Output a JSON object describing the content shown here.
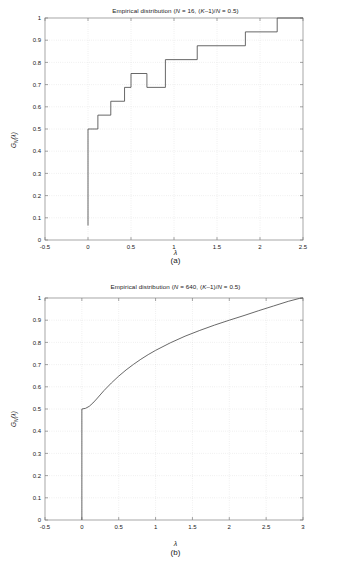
{
  "figure": {
    "background": "#ffffff",
    "line_color": "#4d4d4d",
    "axis_color": "#808080",
    "grid_color": "#cccccc"
  },
  "panel_a": {
    "caption": "(a)",
    "title": "Empirical distribution (N = 16, (K–1)/N = 0.5)",
    "title_parts": {
      "prefix": "Empirical distribution (",
      "n_symbol": "N",
      "n_eq": " = 16, (",
      "k_symbol": "K",
      "k_mid": "–1)/",
      "n_symbol2": "N",
      "suffix": " = 0.5)"
    },
    "xlabel": "λ",
    "ylabel": "G_N(λ)",
    "ylabel_parts": {
      "g": "G",
      "sub": "N",
      "arg": "(λ)"
    }
  },
  "panel_b": {
    "caption": "(b)",
    "title": "Empirical distribution (N = 640, (K–1)/N = 0.5)",
    "title_parts": {
      "prefix": "Empirical distribution (",
      "n_symbol": "N",
      "n_eq": " = 640, (",
      "k_symbol": "K",
      "k_mid": "–1)/",
      "n_symbol2": "N",
      "suffix": " = 0.5)"
    },
    "xlabel": "λ",
    "ylabel": "G_N(λ)",
    "ylabel_parts": {
      "g": "G",
      "sub": "N",
      "arg": "(λ)"
    }
  },
  "chart_data": [
    {
      "type": "line",
      "id": "panel-a",
      "title": "Empirical distribution (N = 16, (K–1)/N = 0.5)",
      "subtitle": "(a)",
      "xlabel": "λ",
      "ylabel": "G_N(λ)",
      "xlim": [
        -0.5,
        2.5
      ],
      "ylim": [
        0,
        1
      ],
      "xticks": [
        -0.5,
        0,
        0.5,
        1,
        1.5,
        2,
        2.5
      ],
      "xticklabels": [
        "-0.5",
        "0",
        "0.5",
        "1",
        "1.5",
        "2",
        "2.5"
      ],
      "yticks": [
        0,
        0.1,
        0.2,
        0.3,
        0.4,
        0.5,
        0.6,
        0.7,
        0.8,
        0.9,
        1
      ],
      "yticklabels": [
        "0",
        "0.1",
        "0.2",
        "0.3",
        "0.4",
        "0.5",
        "0.6",
        "0.7",
        "0.8",
        "0.9",
        "1"
      ],
      "grid": true,
      "grid_style": "dotted",
      "legend": null,
      "N": 16,
      "ratio": 0.5,
      "series": [
        {
          "name": "Empirical CDF N=16",
          "style": "step-post",
          "color": "#4d4d4d",
          "x": [
            0,
            0,
            0.115,
            0.115,
            0.265,
            0.265,
            0.425,
            0.425,
            0.5,
            0.5,
            0.685,
            0.685,
            0.9,
            0.9,
            1.27,
            1.27,
            1.83,
            1.83,
            2.2,
            2.2,
            2.5
          ],
          "y": [
            0.065,
            0.5,
            0.5,
            0.5625,
            0.5625,
            0.625,
            0.625,
            0.6875,
            0.6875,
            0.75,
            0.75,
            0.6875,
            0.6875,
            0.8125,
            0.8125,
            0.875,
            0.875,
            0.9375,
            0.9375,
            1.0,
            1.0
          ]
        }
      ],
      "steps": [
        {
          "x": 0.0,
          "y": 0.5
        },
        {
          "x": 0.115,
          "y": 0.5625
        },
        {
          "x": 0.265,
          "y": 0.625
        },
        {
          "x": 0.425,
          "y": 0.6875
        },
        {
          "x": 0.5,
          "y": 0.75
        },
        {
          "x": 0.685,
          "y": 0.6875
        },
        {
          "x": 0.9,
          "y": 0.8125
        },
        {
          "x": 1.27,
          "y": 0.875
        },
        {
          "x": 1.83,
          "y": 0.9375
        },
        {
          "x": 2.2,
          "y": 1.0
        }
      ]
    },
    {
      "type": "line",
      "id": "panel-b",
      "title": "Empirical distribution (N = 640, (K–1)/N = 0.5)",
      "subtitle": "(b)",
      "xlabel": "λ",
      "ylabel": "G_N(λ)",
      "xlim": [
        -0.5,
        3
      ],
      "ylim": [
        0,
        1
      ],
      "xticks": [
        -0.5,
        0,
        0.5,
        1,
        1.5,
        2,
        2.5,
        3
      ],
      "xticklabels": [
        "-0.5",
        "0",
        "0.5",
        "1",
        "1.5",
        "2",
        "2.5",
        "3"
      ],
      "yticks": [
        0,
        0.1,
        0.2,
        0.3,
        0.4,
        0.5,
        0.6,
        0.7,
        0.8,
        0.9,
        1
      ],
      "yticklabels": [
        "0",
        "0.1",
        "0.2",
        "0.3",
        "0.4",
        "0.5",
        "0.6",
        "0.7",
        "0.8",
        "0.9",
        "1"
      ],
      "grid": true,
      "grid_style": "dotted",
      "legend": null,
      "N": 640,
      "ratio": 0.5,
      "series": [
        {
          "name": "Empirical CDF N=640",
          "style": "line",
          "color": "#4d4d4d",
          "x": [
            0,
            0,
            0.05,
            0.1,
            0.15,
            0.2,
            0.3,
            0.4,
            0.5,
            0.6,
            0.7,
            0.8,
            0.9,
            1.0,
            1.2,
            1.4,
            1.6,
            1.8,
            2.0,
            2.2,
            2.4,
            2.6,
            2.8,
            2.95,
            3.0
          ],
          "y": [
            0.0,
            0.5,
            0.503,
            0.512,
            0.527,
            0.545,
            0.583,
            0.617,
            0.648,
            0.676,
            0.701,
            0.724,
            0.745,
            0.764,
            0.798,
            0.828,
            0.854,
            0.878,
            0.9,
            0.921,
            0.943,
            0.964,
            0.985,
            0.998,
            1.0
          ]
        }
      ],
      "vertical_jump": {
        "x": 0.0,
        "from": 0.0,
        "to": 0.5
      }
    }
  ]
}
